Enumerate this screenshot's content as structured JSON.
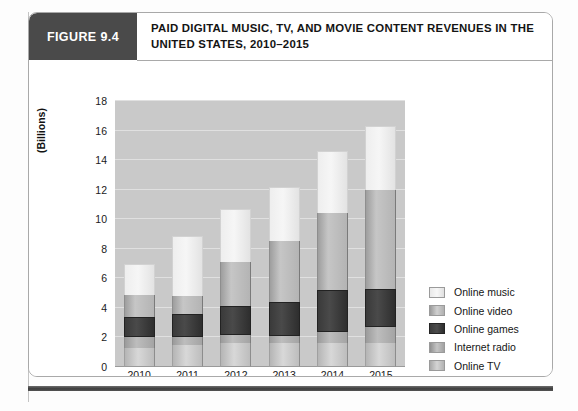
{
  "figure": {
    "tag": "FIGURE 9.4",
    "title": "PAID DIGITAL MUSIC, TV, AND MOVIE CONTENT REVENUES IN THE UNITED STATES, 2010–2015"
  },
  "legend": {
    "position": "right",
    "items": [
      {
        "label": "Online music",
        "swatch": "online-music-swatch",
        "color": "#f0f0f0"
      },
      {
        "label": "Online video",
        "swatch": "online-video-swatch",
        "color": "#b4b4b4"
      },
      {
        "label": "Online games",
        "swatch": "online-games-swatch",
        "color": "#3a3a3a"
      },
      {
        "label": "Internet radio",
        "swatch": "internet-radio-swatch",
        "color": "#a8a8a8"
      },
      {
        "label": "Online TV",
        "swatch": "online-tv-swatch",
        "color": "#c6c6c6"
      }
    ]
  },
  "axes": {
    "y_title": "(Billions)",
    "y_ticks": [
      "0",
      "2",
      "4",
      "6",
      "8",
      "10",
      "12",
      "14",
      "16",
      "18"
    ],
    "x_ticks": [
      "2010",
      "2011",
      "2012",
      "2013",
      "2014",
      "2015"
    ]
  },
  "chart_data": {
    "type": "bar",
    "stacked": true,
    "title": "PAID DIGITAL MUSIC, TV, AND MOVIE CONTENT REVENUES IN THE UNITED STATES, 2010–2015",
    "xlabel": "",
    "ylabel": "(Billions)",
    "ylim": [
      0,
      18
    ],
    "ytick_step": 2,
    "grid": true,
    "legend_position": "right",
    "categories": [
      "2010",
      "2011",
      "2012",
      "2013",
      "2014",
      "2015"
    ],
    "series": [
      {
        "name": "Online TV",
        "values": [
          1.3,
          1.5,
          1.6,
          1.6,
          1.6,
          1.6
        ]
      },
      {
        "name": "Internet radio",
        "values": [
          0.7,
          0.5,
          0.6,
          0.5,
          0.8,
          1.1
        ]
      },
      {
        "name": "Online games",
        "values": [
          1.4,
          1.6,
          1.9,
          2.3,
          2.8,
          2.6
        ]
      },
      {
        "name": "Online video",
        "values": [
          1.5,
          1.2,
          3.0,
          4.1,
          5.2,
          6.7
        ]
      },
      {
        "name": "Online music",
        "values": [
          2.1,
          4.1,
          3.6,
          3.7,
          4.2,
          4.3
        ]
      }
    ],
    "totals": [
      7.0,
      8.9,
      10.7,
      12.2,
      14.6,
      16.3
    ]
  }
}
